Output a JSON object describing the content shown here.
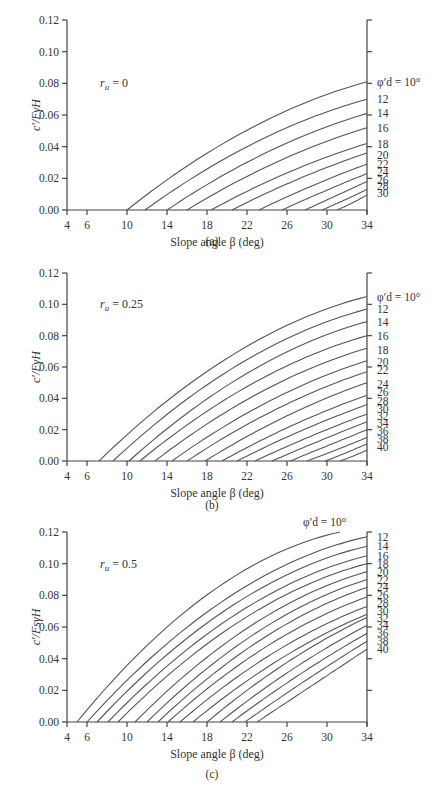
{
  "chart_data": [
    {
      "type": "line",
      "panel": "(a)",
      "title": "r_u = 0",
      "ru_symbol": "r",
      "ru_sub": "u",
      "ru_value": " = 0",
      "xlabel": "Slope angle β (deg)",
      "ylabel": "c′/FγH",
      "xlim": [
        4,
        34
      ],
      "ylim": [
        0,
        0.12
      ],
      "xticks": [
        4,
        6,
        10,
        14,
        18,
        22,
        26,
        30,
        34
      ],
      "yticks": [
        0.0,
        0.02,
        0.04,
        0.06,
        0.08,
        0.1,
        0.12
      ],
      "ytick_labels": [
        "0.00",
        "0.02",
        "0.04",
        "0.06",
        "0.08",
        "0.10",
        "0.12"
      ],
      "right_ticks": [
        0.12,
        0.1,
        0.08,
        0.06,
        0.04,
        0.02
      ],
      "legend_prefix": "φ′d = ",
      "series": [
        {
          "name": "10°",
          "label": "φ′d = 10°",
          "start_beta": 10.0,
          "end_value": 0.081,
          "curv": 0.35
        },
        {
          "name": "12",
          "label": "12",
          "start_beta": 11.8,
          "end_value": 0.07,
          "curv": 0.32
        },
        {
          "name": "14",
          "label": "14",
          "start_beta": 14.0,
          "end_value": 0.061,
          "curv": 0.28
        },
        {
          "name": "16",
          "label": "16",
          "start_beta": 16.0,
          "end_value": 0.052,
          "curv": 0.24
        },
        {
          "name": "18",
          "label": "18",
          "start_beta": 18.4,
          "end_value": 0.042,
          "curv": 0.2
        },
        {
          "name": "20",
          "label": "20",
          "start_beta": 20.5,
          "end_value": 0.036,
          "curv": 0.15
        },
        {
          "name": "22",
          "label": "22",
          "start_beta": 23.2,
          "end_value": 0.029,
          "curv": 0.1
        },
        {
          "name": "24",
          "label": "24",
          "start_beta": 25.5,
          "end_value": 0.023,
          "curv": 0.05
        },
        {
          "name": "26",
          "label": "26",
          "start_beta": 27.8,
          "end_value": 0.018,
          "curv": 0.0
        },
        {
          "name": "28",
          "label": "28",
          "start_beta": 29.5,
          "end_value": 0.013,
          "curv": -0.05
        },
        {
          "name": "30",
          "label": "30",
          "start_beta": 31.0,
          "end_value": 0.0095,
          "curv": -0.1
        }
      ],
      "label_y_values": [
        0.081,
        0.07,
        0.061,
        0.052,
        0.042,
        0.035,
        0.029,
        0.024,
        0.019,
        0.015,
        0.011
      ]
    },
    {
      "type": "line",
      "panel": "(b)",
      "title": "r_u = 0.25",
      "ru_symbol": "r",
      "ru_sub": "u",
      "ru_value": " = 0.25",
      "xlabel": "Slope angle β (deg)",
      "ylabel": "c′/FγH",
      "xlim": [
        4,
        34
      ],
      "ylim": [
        0,
        0.12
      ],
      "xticks": [
        4,
        6,
        10,
        14,
        18,
        22,
        26,
        30,
        34
      ],
      "yticks": [
        0.0,
        0.02,
        0.04,
        0.06,
        0.08,
        0.1,
        0.12
      ],
      "ytick_labels": [
        "0.00",
        "0.02",
        "0.04",
        "0.06",
        "0.08",
        "0.10",
        "0.12"
      ],
      "right_ticks": [
        0.12,
        0.1,
        0.08,
        0.06,
        0.04,
        0.02
      ],
      "legend_prefix": "φ′d = ",
      "series": [
        {
          "name": "10°",
          "label": "φ′d = 10°",
          "start_beta": 7.2,
          "end_value": 0.105,
          "curv": 0.42
        },
        {
          "name": "12",
          "label": "12",
          "start_beta": 8.6,
          "end_value": 0.097,
          "curv": 0.4
        },
        {
          "name": "14",
          "label": "14",
          "start_beta": 10.2,
          "end_value": 0.089,
          "curv": 0.38
        },
        {
          "name": "16",
          "label": "16",
          "start_beta": 11.3,
          "end_value": 0.08,
          "curv": 0.35
        },
        {
          "name": "18",
          "label": "18",
          "start_beta": 12.8,
          "end_value": 0.072,
          "curv": 0.32
        },
        {
          "name": "20",
          "label": "20",
          "start_beta": 14.5,
          "end_value": 0.064,
          "curv": 0.28
        },
        {
          "name": "22",
          "label": "22",
          "start_beta": 16.0,
          "end_value": 0.057,
          "curv": 0.24
        },
        {
          "name": "24",
          "label": "24",
          "start_beta": 17.8,
          "end_value": 0.05,
          "curv": 0.2
        },
        {
          "name": "26",
          "label": "26",
          "start_beta": 19.5,
          "end_value": 0.042,
          "curv": 0.16
        },
        {
          "name": "28",
          "label": "28",
          "start_beta": 21.0,
          "end_value": 0.036,
          "curv": 0.12
        },
        {
          "name": "30",
          "label": "30",
          "start_beta": 22.8,
          "end_value": 0.03,
          "curv": 0.08
        },
        {
          "name": "32",
          "label": "32",
          "start_beta": 24.5,
          "end_value": 0.025,
          "curv": 0.04
        },
        {
          "name": "34",
          "label": "34",
          "start_beta": 26.3,
          "end_value": 0.02,
          "curv": 0.0
        },
        {
          "name": "36",
          "label": "36",
          "start_beta": 28.0,
          "end_value": 0.015,
          "curv": -0.04
        },
        {
          "name": "38",
          "label": "38",
          "start_beta": 29.8,
          "end_value": 0.011,
          "curv": -0.08
        },
        {
          "name": "40",
          "label": "40",
          "start_beta": 31.3,
          "end_value": 0.007,
          "curv": -0.1
        }
      ],
      "label_y_values": [
        0.105,
        0.097,
        0.089,
        0.08,
        0.071,
        0.063,
        0.058,
        0.049,
        0.044,
        0.038,
        0.033,
        0.029,
        0.024,
        0.019,
        0.014,
        0.009
      ]
    },
    {
      "type": "line",
      "panel": "(c)",
      "title": "r_u = 0.5",
      "ru_symbol": "r",
      "ru_sub": "u",
      "ru_value": " = 0.5",
      "xlabel": "Slope angle β (deg)",
      "ylabel": "c′/FsγH",
      "xlim": [
        4,
        34
      ],
      "ylim": [
        0,
        0.12
      ],
      "xticks": [
        4,
        6,
        10,
        14,
        18,
        22,
        26,
        30,
        34
      ],
      "yticks": [
        0.0,
        0.02,
        0.04,
        0.06,
        0.08,
        0.1,
        0.12
      ],
      "ytick_labels": [
        "0.00",
        "0.02",
        "0.04",
        "0.06",
        "0.08",
        "0.10",
        "0.12"
      ],
      "right_ticks": [
        0.12,
        0.1,
        0.08,
        0.06,
        0.04,
        0.02
      ],
      "legend_prefix": "φ′d = ",
      "top_label": "φ′d = 10°",
      "series": [
        {
          "name": "10°",
          "label": "",
          "start_beta": 5.0,
          "end_beta": 31.3,
          "end_value": 0.12,
          "curv": 0.5
        },
        {
          "name": "12",
          "label": "12",
          "start_beta": 6.0,
          "end_value": 0.117,
          "curv": 0.48
        },
        {
          "name": "14",
          "label": "14",
          "start_beta": 7.0,
          "end_value": 0.111,
          "curv": 0.46
        },
        {
          "name": "16",
          "label": "16",
          "start_beta": 8.1,
          "end_value": 0.105,
          "curv": 0.44
        },
        {
          "name": "18",
          "label": "18",
          "start_beta": 9.1,
          "end_value": 0.1,
          "curv": 0.42
        },
        {
          "name": "20",
          "label": "20",
          "start_beta": 10.8,
          "end_value": 0.095,
          "curv": 0.4
        },
        {
          "name": "22",
          "label": "22",
          "start_beta": 12.0,
          "end_value": 0.09,
          "curv": 0.37
        },
        {
          "name": "24",
          "label": "24",
          "start_beta": 13.1,
          "end_value": 0.085,
          "curv": 0.34
        },
        {
          "name": "26",
          "label": "26",
          "start_beta": 14.1,
          "end_value": 0.079,
          "curv": 0.31
        },
        {
          "name": "28",
          "label": "28",
          "start_beta": 15.3,
          "end_value": 0.073,
          "curv": 0.28
        },
        {
          "name": "30",
          "label": "30",
          "start_beta": 16.6,
          "end_value": 0.068,
          "curv": 0.24
        },
        {
          "name": "32",
          "label": "32",
          "start_beta": 18.0,
          "end_value": 0.066,
          "curv": 0.2
        },
        {
          "name": "34",
          "label": "34",
          "start_beta": 19.3,
          "end_value": 0.061,
          "curv": 0.15
        },
        {
          "name": "36",
          "label": "36",
          "start_beta": 20.5,
          "end_value": 0.056,
          "curv": 0.1
        },
        {
          "name": "38",
          "label": "38",
          "start_beta": 21.8,
          "end_value": 0.051,
          "curv": 0.05
        },
        {
          "name": "40",
          "label": "40",
          "start_beta": 23.0,
          "end_value": 0.046,
          "curv": 0.0
        }
      ],
      "label_y_values": [
        null,
        0.117,
        0.111,
        0.105,
        0.1,
        0.095,
        0.09,
        0.085,
        0.08,
        0.075,
        0.07,
        0.066,
        0.061,
        0.056,
        0.051,
        0.046
      ]
    }
  ]
}
